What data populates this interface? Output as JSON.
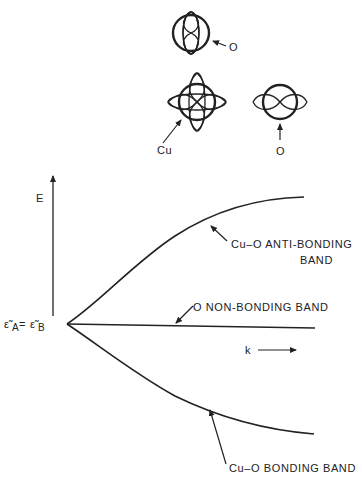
{
  "figure": {
    "orbitals": {
      "top_o_label": "O",
      "cu_label": "Cu",
      "right_o_label": "O"
    },
    "axes": {
      "y_label": "E",
      "x_label": "k",
      "origin_label_left": "ε̃",
      "origin_sub_a": "A",
      "origin_eq": " = ",
      "origin_label_right": "ε̃",
      "origin_sub_b": "B"
    },
    "bands": {
      "antibonding_line1": "Cu–O ANTI-BONDING",
      "antibonding_line2": "BAND",
      "nonbonding": "O NON-BONDING BAND",
      "bonding": "Cu–O BONDING BAND"
    },
    "colors": {
      "ink": "#222222",
      "background": "#ffffff"
    }
  }
}
